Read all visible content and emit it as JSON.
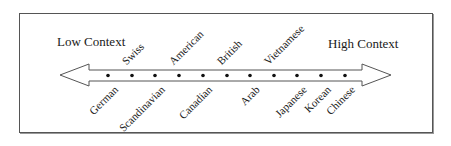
{
  "diagram": {
    "left_label": "Low Context",
    "right_label": "High Context",
    "line_color": "#555555",
    "dot_color": "#111111",
    "points": [
      {
        "label": "German",
        "position": "below",
        "x": 108
      },
      {
        "label": "Swiss",
        "position": "above",
        "x": 132
      },
      {
        "label": "Scandinavian",
        "position": "below",
        "x": 155
      },
      {
        "label": "American",
        "position": "above",
        "x": 179
      },
      {
        "label": "Canadian",
        "position": "below",
        "x": 203
      },
      {
        "label": "British",
        "position": "above",
        "x": 227
      },
      {
        "label": "Arab",
        "position": "below",
        "x": 250
      },
      {
        "label": "Vietnamese",
        "position": "above",
        "x": 274
      },
      {
        "label": "Japanese",
        "position": "below",
        "x": 297
      },
      {
        "label": "Korean",
        "position": "below",
        "x": 321
      },
      {
        "label": "Chinese",
        "position": "below",
        "x": 345
      }
    ]
  }
}
